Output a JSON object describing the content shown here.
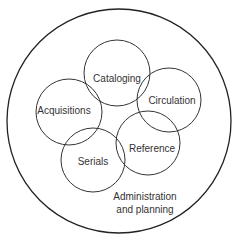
{
  "diagram": {
    "outer": {
      "label_line1": "Administration",
      "label_line2": "and planning"
    },
    "circles": [
      {
        "id": "cataloging",
        "label": "Cataloging"
      },
      {
        "id": "circulation",
        "label": "Circulation"
      },
      {
        "id": "acquisitions",
        "label": "Acquisitions"
      },
      {
        "id": "reference",
        "label": "Reference"
      },
      {
        "id": "serials",
        "label": "Serials"
      }
    ]
  }
}
